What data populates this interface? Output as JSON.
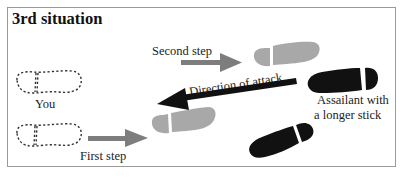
{
  "diagram": {
    "title": "3rd situation",
    "labels": {
      "you": "You",
      "second_step": "Second step",
      "first_step": "First step",
      "direction": "Direction of attack",
      "assailant_line1": "Assailant with",
      "assailant_line2": "a longer stick"
    },
    "colors": {
      "border": "#9a9a9a",
      "grey_foot": "#a8a8a8",
      "grey_arrow": "#7d7d7d",
      "black": "#111111",
      "dashed": "#333333"
    },
    "elements": [
      {
        "id": "you-foot-top",
        "type": "dashed-footprint"
      },
      {
        "id": "you-foot-bottom",
        "type": "dashed-footprint"
      },
      {
        "id": "second-step-foot",
        "type": "grey-footprint"
      },
      {
        "id": "first-step-foot",
        "type": "grey-footprint"
      },
      {
        "id": "assailant-foot-top",
        "type": "black-footprint"
      },
      {
        "id": "assailant-foot-bottom",
        "type": "black-footprint"
      },
      {
        "id": "first-step-arrow",
        "type": "grey-arrow"
      },
      {
        "id": "second-step-arrow",
        "type": "grey-arrow"
      },
      {
        "id": "attack-arrow",
        "type": "black-arrow"
      }
    ]
  }
}
